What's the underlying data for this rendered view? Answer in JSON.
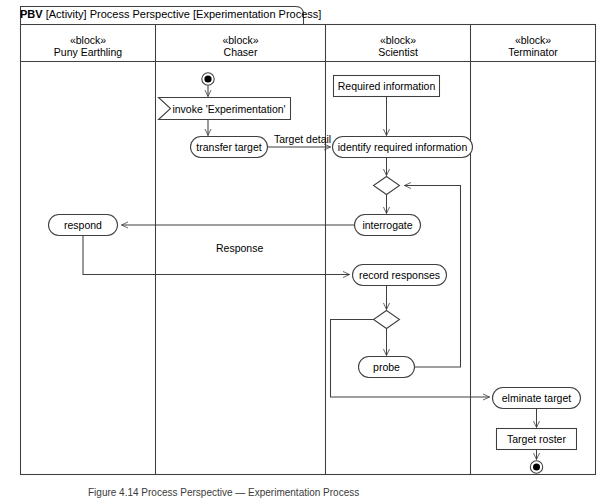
{
  "diagram": {
    "frame_label_prefix": "PBV",
    "frame_label_rest": " [Activity] Process Perspective [Experimentation Process]",
    "caption": "Figure 4.14 Process Perspective — Experimentation Process",
    "stroke_color": "#3f3f3f",
    "fill_color": "#ffffff",
    "text_color": "#000000"
  },
  "lanes": [
    {
      "id": "puny-earthling",
      "stereotype": "«block»",
      "name": "Puny Earthling"
    },
    {
      "id": "chaser",
      "stereotype": "«block»",
      "name": "Chaser"
    },
    {
      "id": "scientist",
      "stereotype": "«block»",
      "name": "Scientist"
    },
    {
      "id": "terminator",
      "stereotype": "«block»",
      "name": "Terminator"
    }
  ],
  "nodes": {
    "initial": {
      "type": "initial-node",
      "lane": "chaser"
    },
    "invoke": {
      "type": "accept-signal",
      "lane": "chaser",
      "label": "invoke 'Experimentation'"
    },
    "transfer_target": {
      "type": "action",
      "lane": "chaser",
      "label": "transfer target"
    },
    "required_information": {
      "type": "object-node",
      "lane": "scientist",
      "label": "Required information"
    },
    "identify_required_information": {
      "type": "action",
      "lane": "scientist",
      "label": "identify required information"
    },
    "decision_1": {
      "type": "decision",
      "lane": "scientist"
    },
    "interrogate": {
      "type": "action",
      "lane": "scientist",
      "label": "interrogate"
    },
    "respond": {
      "type": "action",
      "lane": "puny-earthling",
      "label": "respond"
    },
    "record_responses": {
      "type": "action",
      "lane": "scientist",
      "label": "record responses"
    },
    "decision_2": {
      "type": "decision",
      "lane": "scientist"
    },
    "probe": {
      "type": "action",
      "lane": "scientist",
      "label": "probe"
    },
    "elminate_target": {
      "type": "action",
      "lane": "terminator",
      "label": "elminate target"
    },
    "target_roster": {
      "type": "object-node",
      "lane": "terminator",
      "label": "Target roster"
    },
    "final": {
      "type": "final-node",
      "lane": "terminator"
    }
  },
  "edges": [
    {
      "from": "initial",
      "to": "invoke",
      "label": ""
    },
    {
      "from": "invoke",
      "to": "transfer_target",
      "label": ""
    },
    {
      "from": "transfer_target",
      "to": "identify_required_information",
      "label": "Target detail"
    },
    {
      "from": "required_information",
      "to": "identify_required_information",
      "label": ""
    },
    {
      "from": "identify_required_information",
      "to": "decision_1",
      "label": ""
    },
    {
      "from": "decision_1",
      "to": "interrogate",
      "label": ""
    },
    {
      "from": "interrogate",
      "to": "respond",
      "label": ""
    },
    {
      "from": "respond",
      "to": "record_responses",
      "label": "Response"
    },
    {
      "from": "record_responses",
      "to": "decision_2",
      "label": ""
    },
    {
      "from": "decision_2",
      "to": "probe",
      "label": ""
    },
    {
      "from": "probe",
      "to": "decision_1",
      "label": ""
    },
    {
      "from": "decision_2",
      "to": "elminate_target",
      "label": ""
    },
    {
      "from": "elminate_target",
      "to": "target_roster",
      "label": ""
    },
    {
      "from": "target_roster",
      "to": "final",
      "label": ""
    }
  ]
}
